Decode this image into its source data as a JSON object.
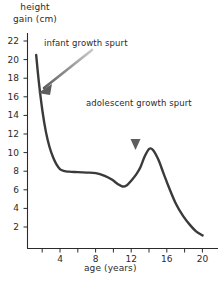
{
  "chart_data": {
    "type": "line",
    "title": "",
    "subtitle": "",
    "xlabel": "age (years)",
    "ylabel": "height gain (cm)",
    "ylabel_line1": "height",
    "ylabel_line2": "gain (cm)",
    "xlim": [
      0,
      21.5
    ],
    "ylim": [
      0,
      23
    ],
    "grid": false,
    "legend": "none",
    "line_color": "#3a3a3a",
    "axis_color": "#2b2b2b",
    "annotation_color": "#8f8f8f",
    "xticks": [
      2,
      4,
      6,
      8,
      10,
      12,
      14,
      16,
      18,
      20
    ],
    "xtick_labels": [
      "",
      "4",
      "",
      "8",
      "",
      "12",
      "",
      "16",
      "",
      "20"
    ],
    "yticks": [
      2,
      4,
      6,
      8,
      10,
      12,
      14,
      16,
      18,
      20,
      22
    ],
    "ytick_labels": [
      "2",
      "4",
      "6",
      "8",
      "10",
      "12",
      "14",
      "16",
      "18",
      "20",
      "22"
    ],
    "series": [
      {
        "name": "height gain",
        "x": [
          1.3,
          1.6,
          2.0,
          2.4,
          2.8,
          3.2,
          3.6,
          4.0,
          4.5,
          5.0,
          6.0,
          7.0,
          8.0,
          9.0,
          9.8,
          10.5,
          11.0,
          11.5,
          12.0,
          12.5,
          13.0,
          13.5,
          14.0,
          14.4,
          15.0,
          15.6,
          16.2,
          17.0,
          17.8,
          18.6,
          19.3,
          20.0
        ],
        "y": [
          20.5,
          17.6,
          14.5,
          12.2,
          10.6,
          9.5,
          8.7,
          8.2,
          8.0,
          7.95,
          7.9,
          7.85,
          7.8,
          7.5,
          7.1,
          6.6,
          6.35,
          6.5,
          7.0,
          7.6,
          8.4,
          9.6,
          10.4,
          10.3,
          9.3,
          7.8,
          6.3,
          4.5,
          3.2,
          2.2,
          1.5,
          1.1
        ]
      }
    ],
    "annotations": [
      {
        "name": "infant-growth-spurt",
        "text": "infant growth spurt",
        "arrow": "diagonal-down-left",
        "points_to_x": 2.0,
        "points_to_y": 14.5
      },
      {
        "name": "adolescent-growth-spurt",
        "text": "adolescent growth spurt",
        "arrow": "down",
        "points_to_x": 13.0,
        "points_to_y": 11.2
      }
    ]
  }
}
